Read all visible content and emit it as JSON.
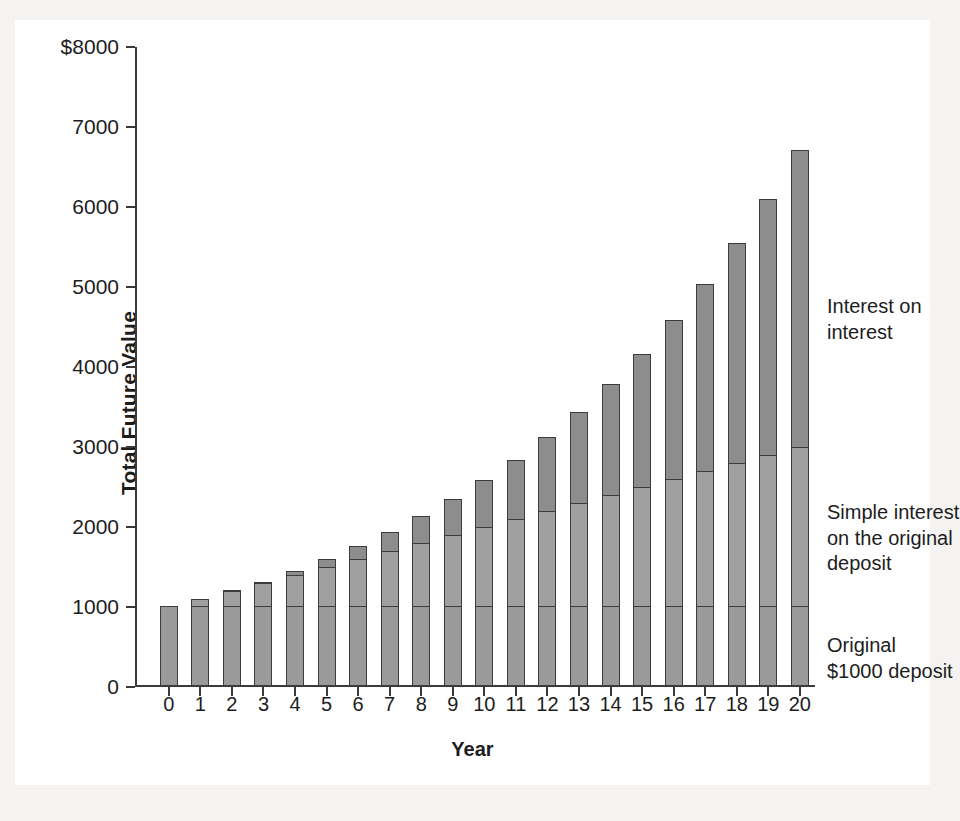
{
  "page": {
    "cropped_top_text_left": "",
    "cropped_top_text_right": ""
  },
  "chart_data": {
    "type": "bar",
    "stacked": true,
    "title": "",
    "xlabel": "Year",
    "ylabel": "Total Future Value",
    "ylim": [
      0,
      8000
    ],
    "ytick_values": [
      0,
      1000,
      2000,
      3000,
      4000,
      5000,
      6000,
      7000,
      8000
    ],
    "ytick_labels": [
      "0",
      "1000",
      "2000",
      "3000",
      "4000",
      "5000",
      "6000",
      "7000",
      "$8000"
    ],
    "grid": false,
    "legend_position": "right-inline-annotations",
    "categories": [
      "0",
      "1",
      "2",
      "3",
      "4",
      "5",
      "6",
      "7",
      "8",
      "9",
      "10",
      "11",
      "12",
      "13",
      "14",
      "15",
      "16",
      "17",
      "18",
      "19",
      "20"
    ],
    "x": [
      0,
      1,
      2,
      3,
      4,
      5,
      6,
      7,
      8,
      9,
      10,
      11,
      12,
      13,
      14,
      15,
      16,
      17,
      18,
      19,
      20
    ],
    "series": [
      {
        "name": "Original $1000 deposit",
        "color": "#9a9a9a",
        "values": [
          1000,
          1000,
          1000,
          1000,
          1000,
          1000,
          1000,
          1000,
          1000,
          1000,
          1000,
          1000,
          1000,
          1000,
          1000,
          1000,
          1000,
          1000,
          1000,
          1000,
          1000
        ]
      },
      {
        "name": "Simple interest on the original deposit",
        "color": "#a0a0a0",
        "values": [
          0,
          100,
          200,
          300,
          400,
          500,
          600,
          700,
          800,
          900,
          1000,
          1100,
          1200,
          1300,
          1400,
          1500,
          1600,
          1700,
          1800,
          1900,
          2000
        ]
      },
      {
        "name": "Interest on interest",
        "color": "#8d8d8d",
        "values": [
          0,
          0,
          10,
          31,
          64,
          111,
          172,
          249,
          344,
          458,
          594,
          753,
          938,
          1152,
          1397,
          1677,
          1995,
          2355,
          2760,
          3216,
          3727
        ]
      }
    ],
    "totals": [
      1000,
      1100,
      1210,
      1331,
      1464,
      1611,
      1772,
      1949,
      2144,
      2358,
      2594,
      2853,
      3138,
      3452,
      3797,
      4177,
      4595,
      5054,
      5560,
      6116,
      6727
    ],
    "annotations": [
      {
        "id": "interest-on-interest",
        "text": "Interest on\ninterest"
      },
      {
        "id": "simple-interest",
        "text": "Simple interest\non the original\ndeposit"
      },
      {
        "id": "original-deposit",
        "text": "Original\n$1000 deposit"
      }
    ]
  }
}
